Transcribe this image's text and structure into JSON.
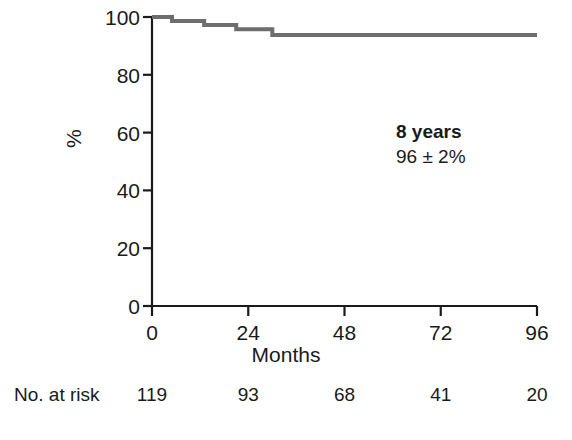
{
  "chart_data": {
    "type": "line",
    "title": "",
    "subtitle": "",
    "xlabel": "Months",
    "ylabel": "%",
    "xlim": [
      0,
      96
    ],
    "ylim": [
      0,
      100
    ],
    "grid": false,
    "legend": null,
    "x_ticks": [
      0,
      24,
      48,
      72,
      96
    ],
    "x_tick_labels": [
      "0",
      "24",
      "48",
      "72",
      "96"
    ],
    "y_ticks": [
      0,
      20,
      40,
      60,
      80,
      100
    ],
    "y_tick_labels": [
      "0",
      "20",
      "40",
      "60",
      "80",
      "100"
    ],
    "series": [
      {
        "name": "Survival",
        "style": "step-post",
        "color": "#6e6e6e",
        "line_width": 4,
        "x": [
          0,
          5,
          5,
          13,
          13,
          21,
          21,
          30,
          30,
          96
        ],
        "y": [
          100,
          100,
          98.6,
          98.6,
          97.2,
          97.2,
          95.8,
          95.8,
          93.8,
          93.8
        ]
      }
    ],
    "annotations": [
      {
        "name": "8-year-survival",
        "title": "8 years",
        "value": "96 ± 2%",
        "x": 74,
        "y": 64
      }
    ],
    "at_risk": {
      "label": "No. at risk",
      "times": [
        0,
        24,
        48,
        72,
        96
      ],
      "counts": [
        "119",
        "93",
        "68",
        "41",
        "20"
      ]
    },
    "axis_color": "#1a1a1a",
    "curve_color": "#6e6e6e"
  }
}
